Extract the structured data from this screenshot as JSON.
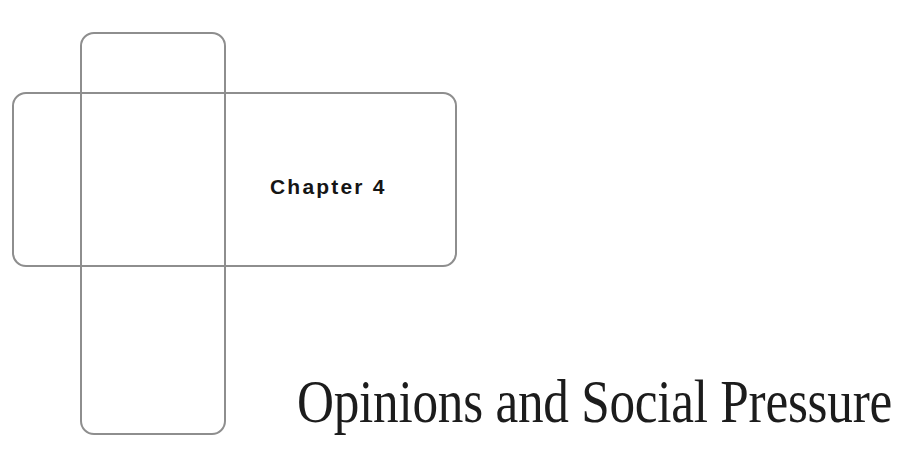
{
  "chapter": {
    "label": "Chapter 4",
    "title": "Opinions and Social Pressure"
  },
  "decoration": {
    "frames": [
      {
        "name": "vertical-rounded-frame",
        "stroke": "#8e8e8e"
      },
      {
        "name": "horizontal-rounded-frame",
        "stroke": "#8e8e8e"
      }
    ]
  },
  "colors": {
    "background": "#ffffff",
    "frame_stroke": "#8e8e8e",
    "text": "#1c1c1c"
  }
}
